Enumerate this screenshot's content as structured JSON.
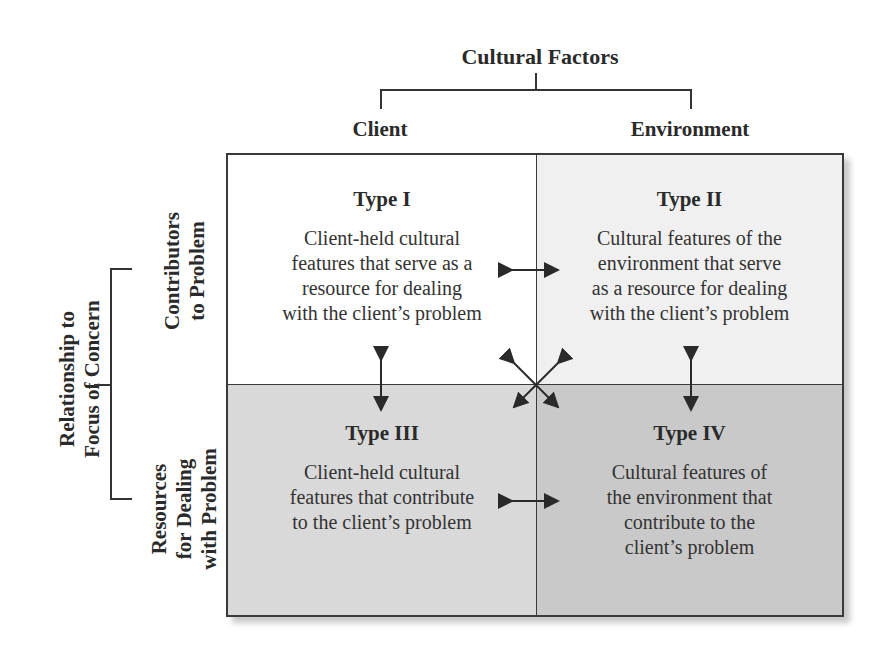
{
  "header": {
    "title": "Cultural Factors",
    "columns": [
      "Client",
      "Environment"
    ]
  },
  "side": {
    "title_lines": [
      "Relationship to",
      "Focus of Concern"
    ],
    "rows": [
      {
        "lines": [
          "Contributors",
          "to Problem"
        ]
      },
      {
        "lines": [
          "Resources",
          "for Dealing",
          "with Problem"
        ]
      }
    ]
  },
  "cells": [
    {
      "type": "Type I",
      "desc": [
        "Client-held cultural",
        "features that serve as a",
        "resource for dealing",
        "with the client’s problem"
      ],
      "bg": "#ffffff"
    },
    {
      "type": "Type II",
      "desc": [
        "Cultural features of the",
        "environment that serve",
        "as a resource for dealing",
        "with the client’s problem"
      ],
      "bg": "#f0f0f0"
    },
    {
      "type": "Type III",
      "desc": [
        "Client-held cultural",
        "features that contribute",
        "to the client’s problem"
      ],
      "bg": "#d9d9d9"
    },
    {
      "type": "Type IV",
      "desc": [
        "Cultural features of",
        "the environment that",
        "contribute to the",
        "client’s problem"
      ],
      "bg": "#c9c9c9"
    }
  ]
}
